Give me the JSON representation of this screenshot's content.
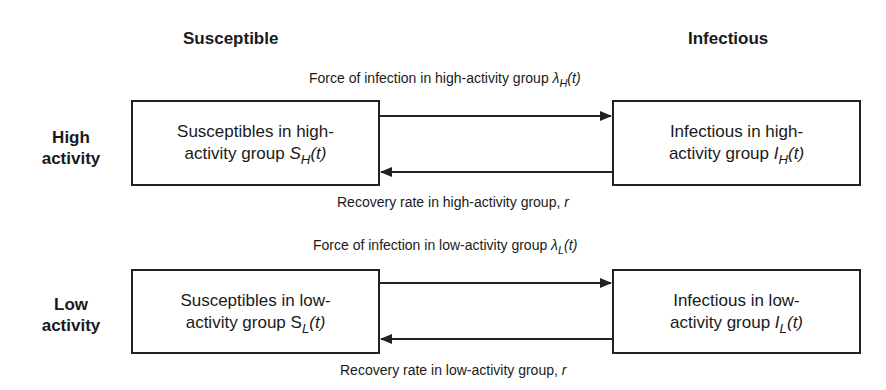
{
  "columns": {
    "left": "Susceptible",
    "right": "Infectious"
  },
  "rows": [
    {
      "label_line1": "High",
      "label_line2": "activity",
      "susceptible": {
        "line1": "Susceptibles in high-",
        "line2": "activity group ",
        "symbol": "S",
        "sub": "H",
        "arg": "(t)"
      },
      "infectious": {
        "line1": "Infectious in high-",
        "line2": "activity group ",
        "symbol": "I",
        "sub": "H",
        "arg": "(t)"
      },
      "infection_arrow": {
        "text": "Force of infection in high-activity group ",
        "symbol": "λ",
        "sub": "H",
        "arg": "(t)"
      },
      "recovery_arrow": {
        "text": "Recovery rate in high-activity group, ",
        "symbol": "r"
      }
    },
    {
      "label_line1": "Low",
      "label_line2": "activity",
      "susceptible": {
        "line1": "Susceptibles in low-",
        "line2": "activity group ",
        "symbol": "S",
        "sub": "L",
        "arg": "(t)"
      },
      "infectious": {
        "line1": "Infectious in low-",
        "line2": "activity group ",
        "symbol": "I",
        "sub": "L",
        "arg": "(t)"
      },
      "infection_arrow": {
        "text": "Force of infection in low-activity group ",
        "symbol": "λ",
        "sub": "L",
        "arg": "(t)"
      },
      "recovery_arrow": {
        "text": "Recovery rate in low-activity group, ",
        "symbol": "r"
      }
    }
  ]
}
